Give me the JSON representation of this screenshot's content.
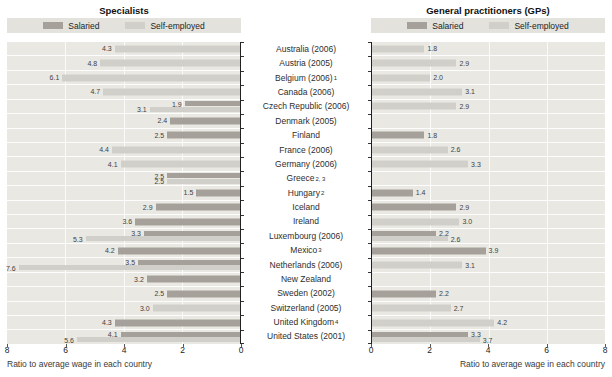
{
  "legend": {
    "salaried": "Salaried",
    "self_employed": "Self-employed"
  },
  "colors": {
    "salaried": "#a5a19a",
    "self_employed": "#d1cfc9",
    "plot_bg": "#e9e8e3",
    "legend_bg": "#e3e2dd",
    "gridline": "#fbfbf9",
    "axis": "#222222"
  },
  "countries": [
    {
      "name": "Australia (2006)",
      "sup": ""
    },
    {
      "name": "Austria (2005)",
      "sup": ""
    },
    {
      "name": "Belgium (2006)",
      "sup": "1"
    },
    {
      "name": "Canada (2006)",
      "sup": ""
    },
    {
      "name": "Czech Republic (2006)",
      "sup": ""
    },
    {
      "name": "Denmark (2005)",
      "sup": ""
    },
    {
      "name": "Finland",
      "sup": ""
    },
    {
      "name": "France (2006)",
      "sup": ""
    },
    {
      "name": "Germany (2006)",
      "sup": ""
    },
    {
      "name": "Greece",
      "sup": "2, 3"
    },
    {
      "name": "Hungary",
      "sup": "2"
    },
    {
      "name": "Iceland",
      "sup": ""
    },
    {
      "name": "Ireland",
      "sup": ""
    },
    {
      "name": "Luxembourg (2006)",
      "sup": ""
    },
    {
      "name": "Mexico",
      "sup": "3"
    },
    {
      "name": "Netherlands (2006)",
      "sup": ""
    },
    {
      "name": "New Zealand",
      "sup": ""
    },
    {
      "name": "Sweden (2002)",
      "sup": ""
    },
    {
      "name": "Switzerland (2005)",
      "sup": ""
    },
    {
      "name": "United Kingdom",
      "sup": "4"
    },
    {
      "name": "United States (2001)",
      "sup": ""
    }
  ],
  "chart_data": [
    {
      "type": "bar",
      "orientation": "horizontal",
      "title": "Specialists",
      "xlabel": "Ratio to average wage in each country",
      "xlim": [
        0,
        8
      ],
      "x_reversed": true,
      "x_ticks": [
        8,
        6,
        4,
        2,
        0
      ],
      "gridlines": [
        2,
        4,
        6
      ],
      "legend_position": "top",
      "categories": [
        "Australia (2006)",
        "Austria (2005)",
        "Belgium (2006)¹",
        "Canada (2006)",
        "Czech Republic (2006)",
        "Denmark (2005)",
        "Finland",
        "France (2006)",
        "Germany (2006)",
        "Greece²·³",
        "Hungary²",
        "Iceland",
        "Ireland",
        "Luxembourg (2006)",
        "Mexico³",
        "Netherlands (2006)",
        "New Zealand",
        "Sweden (2002)",
        "Switzerland (2005)",
        "United Kingdom⁴",
        "United States (2001)"
      ],
      "series": [
        {
          "name": "Salaried",
          "values": [
            null,
            null,
            null,
            null,
            1.9,
            2.4,
            2.5,
            null,
            null,
            2.5,
            1.5,
            2.9,
            3.6,
            3.3,
            4.2,
            3.5,
            3.2,
            2.5,
            null,
            4.3,
            4.1
          ]
        },
        {
          "name": "Self-employed",
          "values": [
            4.3,
            4.8,
            6.1,
            4.7,
            3.1,
            null,
            null,
            4.4,
            4.1,
            2.5,
            null,
            null,
            null,
            5.3,
            null,
            7.6,
            null,
            null,
            3.0,
            null,
            5.6
          ]
        }
      ]
    },
    {
      "type": "bar",
      "orientation": "horizontal",
      "title": "General practitioners (GPs)",
      "xlabel": "Ratio to average wage in each country",
      "xlim": [
        0,
        8
      ],
      "x_reversed": false,
      "x_ticks": [
        0,
        2,
        4,
        6,
        8
      ],
      "gridlines": [
        2,
        4,
        6
      ],
      "legend_position": "top",
      "categories": [
        "Australia (2006)",
        "Austria (2005)",
        "Belgium (2006)¹",
        "Canada (2006)",
        "Czech Republic (2006)",
        "Denmark (2005)",
        "Finland",
        "France (2006)",
        "Germany (2006)",
        "Greece²·³",
        "Hungary²",
        "Iceland",
        "Ireland",
        "Luxembourg (2006)",
        "Mexico³",
        "Netherlands (2006)",
        "New Zealand",
        "Sweden (2002)",
        "Switzerland (2005)",
        "United Kingdom⁴",
        "United States (2001)"
      ],
      "series": [
        {
          "name": "Salaried",
          "values": [
            null,
            null,
            null,
            null,
            null,
            null,
            1.8,
            null,
            null,
            null,
            1.4,
            2.9,
            null,
            2.2,
            3.9,
            null,
            null,
            2.2,
            null,
            null,
            3.3
          ]
        },
        {
          "name": "Self-employed",
          "values": [
            1.8,
            2.9,
            2.0,
            3.1,
            2.9,
            null,
            null,
            2.6,
            3.3,
            null,
            null,
            null,
            3.0,
            2.6,
            null,
            3.1,
            null,
            null,
            2.7,
            4.2,
            3.7
          ]
        }
      ]
    }
  ]
}
